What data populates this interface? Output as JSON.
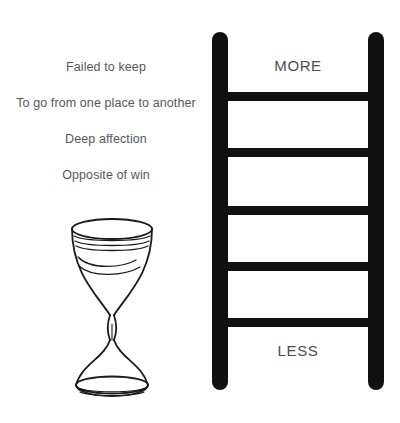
{
  "page": {
    "background_color": "#ffffff",
    "text_color": "#575757",
    "ink_color": "#111111"
  },
  "clues": {
    "items": [
      {
        "text": "Failed to keep"
      },
      {
        "text": "To go from one place to another"
      },
      {
        "text": "Deep affection"
      },
      {
        "text": "Opposite of win"
      }
    ]
  },
  "ladder": {
    "top_label": "MORE",
    "bottom_label": "LESS",
    "rung_count": 5,
    "rail_color": "#111111"
  },
  "hourglass": {
    "outline_color": "#1a1a1a",
    "fill_color": "#ffffff"
  }
}
